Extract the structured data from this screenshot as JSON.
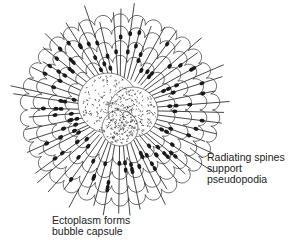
{
  "diagram": {
    "center": {
      "x": 120,
      "y": 110
    },
    "colors": {
      "ink": "#222222",
      "background": "#ffffff"
    },
    "labels": [
      {
        "id": "spines",
        "lines": [
          "Radiating spines",
          "support",
          "pseudopodia"
        ]
      },
      {
        "id": "ectoplasm",
        "lines": [
          "Ectoplasm forms",
          "bubble capsule"
        ]
      }
    ]
  }
}
